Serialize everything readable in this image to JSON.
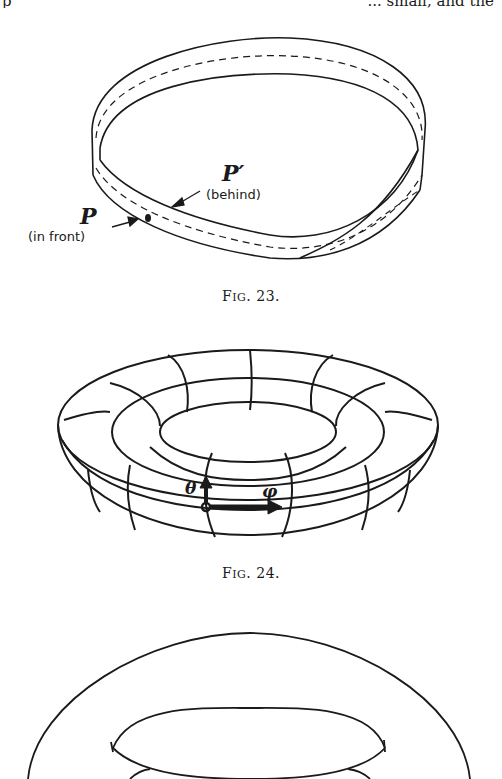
{
  "page": {
    "header": {
      "left_fragment": "p",
      "right_fragment": "... small, and the"
    }
  },
  "figures": [
    {
      "id": "fig23",
      "caption_prefix": "F",
      "caption_smallcaps": "IG",
      "caption_number": ". 23.",
      "subject": "Möbius strip",
      "labels": {
        "p_prime": "P′",
        "p_prime_note": "(behind)",
        "p": "P",
        "p_note": "(in front)"
      }
    },
    {
      "id": "fig24",
      "caption_prefix": "F",
      "caption_smallcaps": "IG",
      "caption_number": ". 24.",
      "subject": "Torus with coordinate grid",
      "labels": {
        "theta": "θ",
        "phi": "φ"
      }
    },
    {
      "id": "fig25",
      "subject": "Torus outline (partial, cut off at bottom)"
    }
  ],
  "colors": {
    "ink": "#1a1a1a",
    "paper": "#ffffff"
  }
}
